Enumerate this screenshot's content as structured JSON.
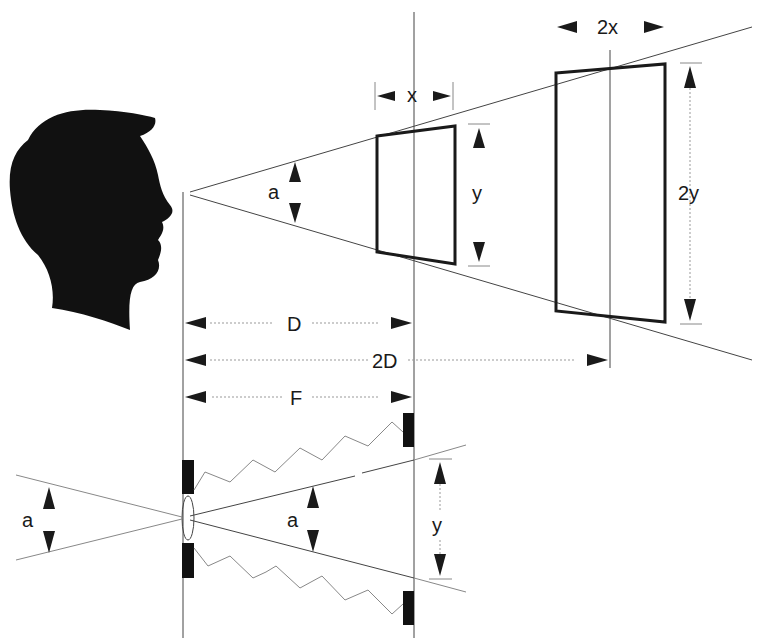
{
  "diagram": {
    "labels": {
      "x": "x",
      "two_x": "2x",
      "y_top": "y",
      "two_y": "2y",
      "a_eye": "a",
      "D": "D",
      "two_D": "2D",
      "F": "F",
      "a_left": "a",
      "a_lens": "a",
      "y_bottom": "y"
    },
    "elements": [
      "head-silhouette",
      "viewing-cone",
      "near-frame",
      "far-frame",
      "distance-dimensions",
      "lens",
      "image-plane",
      "bellows-zigzag"
    ],
    "colors": {
      "ink": "#1a1a1a",
      "line": "#444444",
      "guide": "#999999"
    }
  }
}
